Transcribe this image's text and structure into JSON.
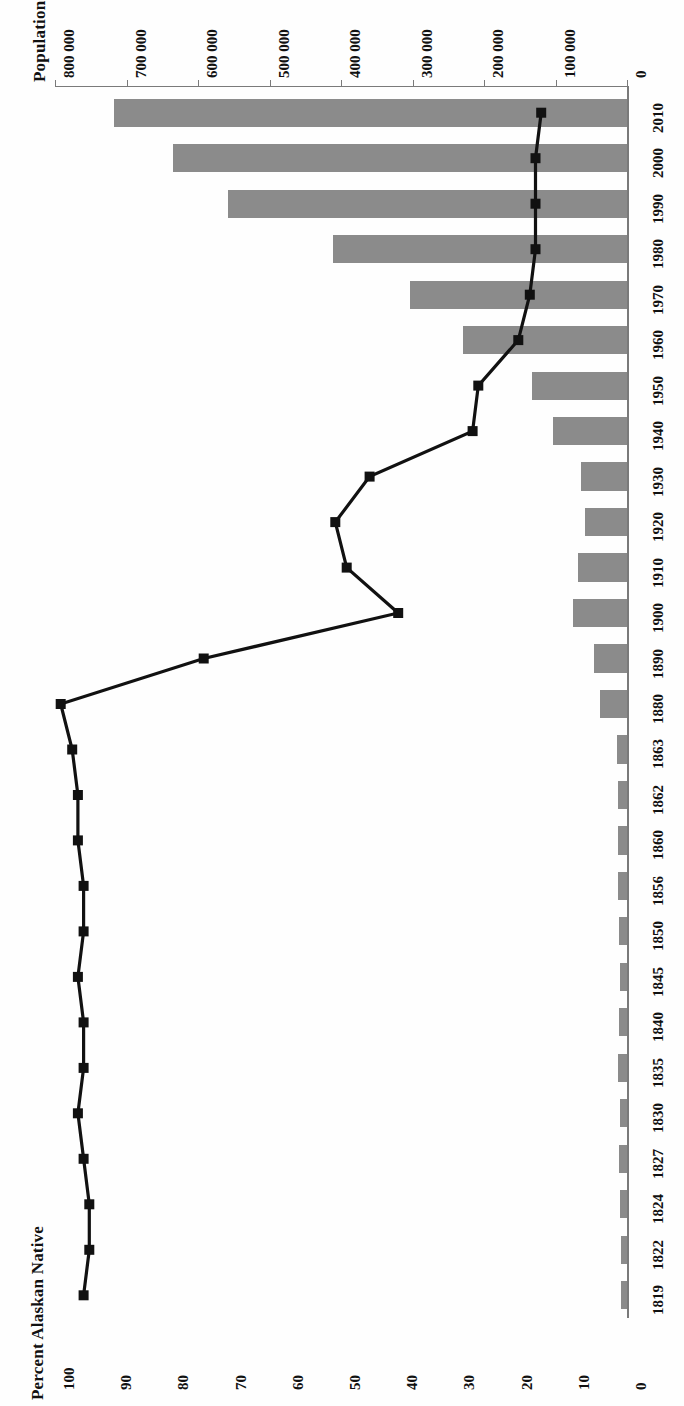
{
  "figure": {
    "orientation": "rotated-90-ccw",
    "background": "#ffffff",
    "bar_color": "#8b8b8b",
    "line_color": "#111111"
  },
  "top_axis": {
    "title": "Population",
    "ticks": [
      "800 000",
      "700 000",
      "600 000",
      "500 000",
      "400 000",
      "300 000",
      "200 000",
      "100 000",
      "0"
    ]
  },
  "bottom_axis": {
    "title": "Percent Alaskan Native",
    "ticks": [
      "100",
      "90",
      "80",
      "70",
      "60",
      "50",
      "40",
      "30",
      "20",
      "10",
      "0"
    ]
  },
  "category_axis": {
    "ticks": [
      "1819",
      "1822",
      "1824",
      "1827",
      "1830",
      "1835",
      "1840",
      "1845",
      "1850",
      "1856",
      "1860",
      "1862",
      "1863",
      "1880",
      "1890",
      "1900",
      "1910",
      "1920",
      "1930",
      "1940",
      "1950",
      "1960",
      "1970",
      "1980",
      "1990",
      "2000",
      "2010"
    ]
  },
  "chart_data": {
    "type": "bar",
    "title": "",
    "subtitle": "",
    "xlabel": "",
    "ylabel": "",
    "grid": false,
    "legend": "none",
    "categories": [
      "1819",
      "1822",
      "1824",
      "1827",
      "1830",
      "1835",
      "1840",
      "1845",
      "1850",
      "1856",
      "1860",
      "1862",
      "1863",
      "1880",
      "1890",
      "1900",
      "1910",
      "1920",
      "1930",
      "1940",
      "1950",
      "1960",
      "1970",
      "1980",
      "1990",
      "2000",
      "2010"
    ],
    "series": [
      {
        "name": "Population",
        "type": "bar",
        "axis": "top",
        "axis_label": "Population",
        "ylim": [
          0,
          800000
        ],
        "tick_values": [
          800000,
          700000,
          600000,
          500000,
          400000,
          300000,
          200000,
          100000,
          0
        ],
        "values": [
          8000,
          9000,
          10000,
          11000,
          10000,
          12000,
          11000,
          10000,
          11000,
          12000,
          12000,
          12000,
          14000,
          38000,
          46000,
          75000,
          69000,
          59000,
          64000,
          104000,
          133000,
          229000,
          303000,
          411000,
          558000,
          635000,
          718000
        ]
      },
      {
        "name": "Percent Alaskan Native",
        "type": "line",
        "marker": "square",
        "axis": "bottom",
        "axis_label": "Percent Alaskan Native",
        "ylim": [
          0,
          100
        ],
        "tick_values": [
          100,
          90,
          80,
          70,
          60,
          50,
          40,
          30,
          20,
          10,
          0
        ],
        "values": [
          95,
          94,
          94,
          95,
          96,
          95,
          95,
          96,
          95,
          95,
          96,
          96,
          97,
          99,
          74,
          40,
          49,
          51,
          45,
          27,
          26,
          19,
          17,
          16,
          16,
          16,
          15
        ]
      }
    ]
  }
}
